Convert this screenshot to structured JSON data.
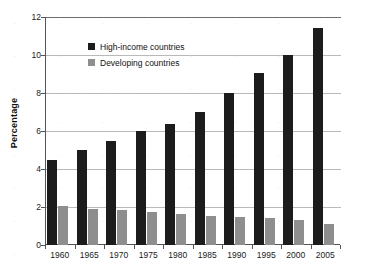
{
  "chart_data": {
    "type": "bar",
    "title": "",
    "xlabel": "",
    "ylabel": "Percentage",
    "ylim": [
      0,
      12
    ],
    "yticks": [
      0,
      2,
      4,
      6,
      8,
      10,
      12
    ],
    "ytick_labels": [
      "0",
      "2",
      "4",
      "6",
      "8",
      "10",
      "12"
    ],
    "grid": true,
    "legend_position": "upper-left-inside",
    "categories": [
      "1960",
      "1965",
      "1970",
      "1975",
      "1980",
      "1985",
      "1990",
      "1995",
      "2000",
      "2005"
    ],
    "series": [
      {
        "name": "High-income countries",
        "color": "#1c1c1c",
        "values": [
          4.5,
          5.0,
          5.5,
          6.0,
          6.35,
          7.0,
          8.0,
          9.05,
          10.0,
          11.4
        ]
      },
      {
        "name": "Developing countries",
        "color": "#8e8e8e",
        "values": [
          2.05,
          1.9,
          1.85,
          1.75,
          1.65,
          1.55,
          1.5,
          1.4,
          1.3,
          1.1
        ]
      }
    ]
  },
  "axes": {
    "y_title": "Percentage"
  },
  "legend": {
    "items": [
      {
        "label": "High-income countries",
        "color": "#1c1c1c"
      },
      {
        "label": "Developing countries",
        "color": "#8e8e8e"
      }
    ]
  },
  "colors": {
    "high_income": "#1c1c1c",
    "developing": "#8e8e8e",
    "gridline": "#b9b9b9",
    "axis": "#555555",
    "background": "#ffffff"
  }
}
